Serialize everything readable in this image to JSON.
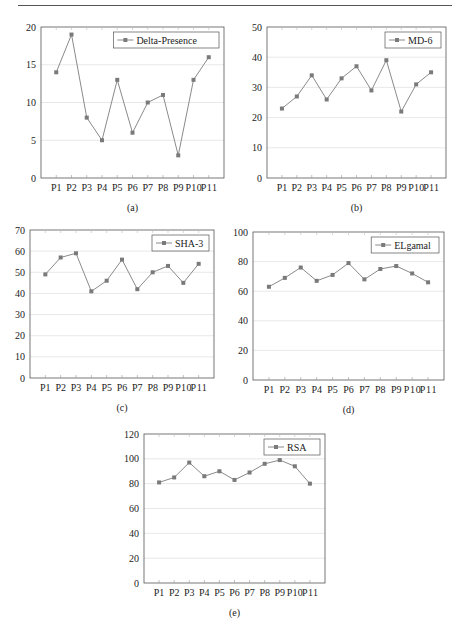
{
  "page": {
    "header_text": ""
  },
  "chart_data": [
    {
      "id": "a",
      "type": "line",
      "caption": "(a)",
      "title": "",
      "xlabel": "",
      "ylabel": "",
      "categories": [
        "P1",
        "P2",
        "P3",
        "P4",
        "P5",
        "P6",
        "P7",
        "P8",
        "P9",
        "P10",
        "P11"
      ],
      "series": [
        {
          "name": "Delta-Presence",
          "values": [
            14,
            19,
            8,
            5,
            13,
            6,
            10,
            11,
            3,
            13,
            16
          ]
        }
      ],
      "ylim": [
        0,
        20
      ],
      "yticks": [
        0,
        5,
        10,
        15,
        20
      ],
      "grid": true,
      "legend_position": "upper right",
      "colors": {
        "line": "#8a8a8a",
        "marker": "#7a7a7a"
      }
    },
    {
      "id": "b",
      "type": "line",
      "caption": "(b)",
      "title": "",
      "xlabel": "",
      "ylabel": "",
      "categories": [
        "P1",
        "P2",
        "P3",
        "P4",
        "P5",
        "P6",
        "P7",
        "P8",
        "P9",
        "P10",
        "P11"
      ],
      "series": [
        {
          "name": "MD-6",
          "values": [
            23,
            27,
            34,
            26,
            33,
            37,
            29,
            39,
            22,
            31,
            35
          ]
        }
      ],
      "ylim": [
        0,
        50
      ],
      "yticks": [
        0,
        10,
        20,
        30,
        40,
        50
      ],
      "grid": true,
      "legend_position": "upper right",
      "colors": {
        "line": "#8a8a8a",
        "marker": "#7a7a7a"
      }
    },
    {
      "id": "c",
      "type": "line",
      "caption": "(c)",
      "title": "",
      "xlabel": "",
      "ylabel": "",
      "categories": [
        "P1",
        "P2",
        "P3",
        "P4",
        "P5",
        "P6",
        "P7",
        "P8",
        "P9",
        "P10",
        "P11"
      ],
      "series": [
        {
          "name": "SHA-3",
          "values": [
            49,
            57,
            59,
            41,
            46,
            56,
            42,
            50,
            53,
            45,
            54
          ]
        }
      ],
      "ylim": [
        0,
        70
      ],
      "yticks": [
        0,
        10,
        20,
        30,
        40,
        50,
        60,
        70
      ],
      "grid": true,
      "legend_position": "upper right",
      "colors": {
        "line": "#8a8a8a",
        "marker": "#7a7a7a"
      }
    },
    {
      "id": "d",
      "type": "line",
      "caption": "(d)",
      "title": "",
      "xlabel": "",
      "ylabel": "",
      "categories": [
        "P1",
        "P2",
        "P3",
        "P4",
        "P5",
        "P6",
        "P7",
        "P8",
        "P9",
        "P10",
        "P11"
      ],
      "series": [
        {
          "name": "ELgamal",
          "values": [
            63,
            69,
            76,
            67,
            71,
            79,
            68,
            75,
            77,
            72,
            66
          ]
        }
      ],
      "ylim": [
        0,
        100
      ],
      "yticks": [
        0,
        20,
        40,
        60,
        80,
        100
      ],
      "grid": true,
      "legend_position": "upper right",
      "colors": {
        "line": "#8a8a8a",
        "marker": "#7a7a7a"
      }
    },
    {
      "id": "e",
      "type": "line",
      "caption": "(e)",
      "title": "",
      "xlabel": "",
      "ylabel": "",
      "categories": [
        "P1",
        "P2",
        "P3",
        "P4",
        "P5",
        "P6",
        "P7",
        "P8",
        "P9",
        "P10",
        "P11"
      ],
      "series": [
        {
          "name": "RSA",
          "values": [
            81,
            85,
            97,
            86,
            90,
            83,
            89,
            96,
            99,
            94,
            80
          ]
        }
      ],
      "ylim": [
        0,
        120
      ],
      "yticks": [
        0,
        20,
        40,
        60,
        80,
        100,
        120
      ],
      "grid": true,
      "legend_position": "upper right",
      "colors": {
        "line": "#8a8a8a",
        "marker": "#7a7a7a"
      }
    }
  ],
  "layout": [
    {
      "left": 41,
      "top": 27,
      "width": 183,
      "height": 151,
      "xlabel_compress": true
    },
    {
      "left": 267,
      "top": 27,
      "width": 179,
      "height": 151
    },
    {
      "left": 30,
      "top": 230,
      "width": 184,
      "height": 148
    },
    {
      "left": 253,
      "top": 232,
      "width": 191,
      "height": 148
    },
    {
      "left": 144,
      "top": 434,
      "width": 181,
      "height": 149
    }
  ]
}
